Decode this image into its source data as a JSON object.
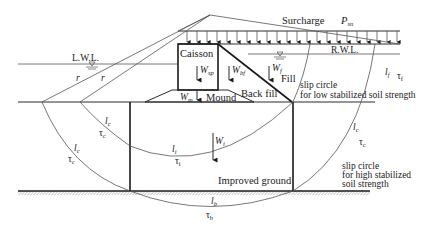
{
  "diagram": {
    "surcharge_label": "Surcharge",
    "surcharge_symbol": "P",
    "surcharge_sub": "sn",
    "lwl_label": "L.W.L.",
    "rwl_label": "R.W.L.",
    "caisson_label": "Caisson",
    "mound_label": "Mound",
    "backfill_label": "Back fill",
    "fill_label": "Fill",
    "improved_ground_label": "Improved ground",
    "r_label_1": "r",
    "r_label_2": "r",
    "weights": {
      "w_sp": {
        "sym": "W",
        "sub": "sp"
      },
      "w_bf": {
        "sym": "W",
        "sub": "bf"
      },
      "w_f": {
        "sym": "W",
        "sub": "f"
      },
      "w_m": {
        "sym": "W",
        "sub": "m"
      },
      "w_i": {
        "sym": "W",
        "sub": "i"
      }
    },
    "segments": {
      "lc_left": {
        "l": "l",
        "l_sub": "c",
        "tau": "τ",
        "tau_sub": "c"
      },
      "lc_inner": {
        "l": "l",
        "l_sub": "c",
        "tau": "τ",
        "tau_sub": "c"
      },
      "li": {
        "l": "l",
        "l_sub": "i",
        "tau": "τ",
        "tau_sub": "i"
      },
      "lb": {
        "l": "l",
        "l_sub": "b",
        "tau": "τ",
        "tau_sub": "b"
      },
      "lf": {
        "l": "l",
        "l_sub": "f",
        "tau": "τ",
        "tau_sub": "f"
      },
      "lc_right": {
        "l": "l",
        "l_sub": "c",
        "tau": "τ",
        "tau_sub": "c"
      }
    },
    "slip_low": {
      "line1": "slip circle",
      "line2": "for low stabilized soil strength"
    },
    "slip_high": {
      "line1": "slip circle",
      "line2": "for high stabilized",
      "line3": "soil strength"
    }
  }
}
